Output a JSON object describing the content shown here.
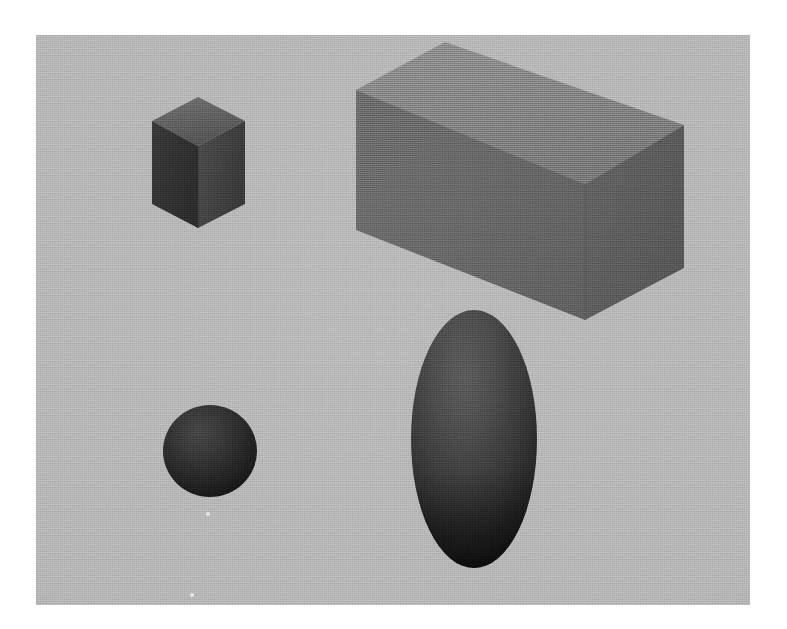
{
  "scene": {
    "title": "Geometric Shapes Scene",
    "description": "Four rendered 3D primitives on a flat gray backdrop",
    "canvas": {
      "left": 36,
      "top": 35,
      "width": 714,
      "height": 570,
      "background_color": "#b4b4b4",
      "page_margin_color": "#ffffff",
      "texture": "halftone-print-grain"
    },
    "objects": [
      {
        "id": "small-cube",
        "name": "small-cube",
        "label": "Small Cube",
        "kind": "cube",
        "size_class": "small",
        "bbox": {
          "x": 152,
          "y": 121,
          "width": 93,
          "height": 107
        },
        "faces": {
          "top": {
            "label": "top-face",
            "color": "#575757",
            "points": "116,86 162,111 209,86 162,62"
          },
          "left": {
            "label": "left-face",
            "color": "#2d2d2d",
            "points": "116,86 162,111 162,193 116,169"
          },
          "right": {
            "label": "right-face",
            "color": "#3c3c3c",
            "points": "162,111 209,86 209,169 162,193"
          }
        }
      },
      {
        "id": "large-box",
        "name": "large-box",
        "label": "Large Rectangular Box",
        "kind": "cuboid",
        "size_class": "large",
        "bbox": {
          "x": 356,
          "y": 42,
          "width": 328,
          "height": 278
        },
        "faces": {
          "top": {
            "label": "top-face",
            "color": "#7d7d7d",
            "points": "320,55 409,7 648,90 549,149"
          },
          "left": {
            "label": "left-face",
            "color": "#5f5f5f",
            "points": "320,55 549,149 549,285 320,195"
          },
          "right": {
            "label": "right-face",
            "color": "#565656",
            "points": "549,149 648,90 648,233 549,285"
          }
        }
      },
      {
        "id": "small-sphere",
        "name": "small-sphere",
        "label": "Small Sphere",
        "kind": "sphere",
        "size_class": "small",
        "bbox": {
          "x": 163,
          "y": 405,
          "width": 94,
          "height": 92
        },
        "center": {
          "cx": 174,
          "cy": 416,
          "rx": 47,
          "ry": 46
        },
        "color_light": "#3a3a3a",
        "color_dark": "#121212"
      },
      {
        "id": "large-ellipsoid",
        "name": "large-ellipsoid",
        "label": "Large Ellipsoid",
        "kind": "ellipsoid",
        "size_class": "large",
        "bbox": {
          "x": 412,
          "y": 310,
          "width": 125,
          "height": 258
        },
        "center": {
          "cx": 438,
          "cy": 404,
          "rx": 63,
          "ry": 129
        },
        "color_light": "#4a4a4a",
        "color_dark": "#0d0d0d"
      }
    ],
    "specks": [
      {
        "name": "dust-speck-1",
        "x": 206,
        "y": 512,
        "size": 4
      },
      {
        "name": "dust-speck-2",
        "x": 190,
        "y": 593,
        "size": 4
      }
    ]
  }
}
